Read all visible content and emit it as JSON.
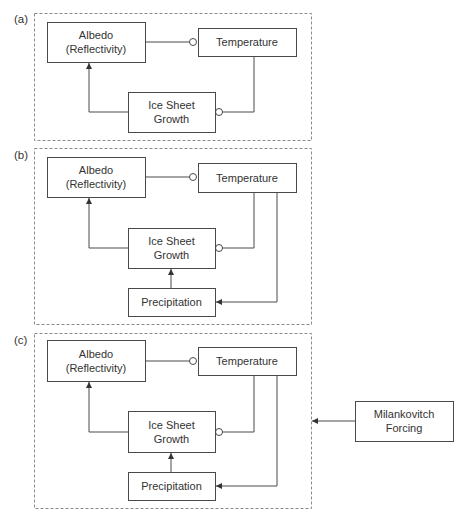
{
  "figure": {
    "width": 465,
    "height": 524,
    "colors": {
      "stroke": "#4a4a4a",
      "panel_border": "#8a8a8a",
      "text": "#333333",
      "background": "#ffffff"
    },
    "legend_semantics": {
      "arrow": "positive effect",
      "circle": "negative effect"
    }
  },
  "panels": [
    {
      "id": "a",
      "label": "(a)",
      "label_pos": [
        14,
        23
      ],
      "rect": [
        34,
        13,
        277,
        127
      ],
      "nodes": [
        {
          "id": "albedo",
          "lines": [
            "Albedo",
            "(Reflectivity)"
          ],
          "rect": [
            47,
            22,
            98,
            40
          ]
        },
        {
          "id": "temperature",
          "lines": [
            "Temperature"
          ],
          "rect": [
            198,
            28,
            98,
            28
          ]
        },
        {
          "id": "ice",
          "lines": [
            "Ice Sheet",
            "Growth"
          ],
          "rect": [
            128,
            92,
            87,
            40
          ]
        }
      ],
      "edges": [
        {
          "from": "albedo",
          "to": "temperature",
          "type": "negative",
          "points": [
            [
              145,
              42
            ],
            [
              193,
              42
            ]
          ],
          "marker_at": [
            193,
            42
          ]
        },
        {
          "from": "temperature",
          "to": "ice",
          "type": "negative",
          "points": [
            [
              254,
              56
            ],
            [
              254,
              112
            ],
            [
              219,
              112
            ]
          ],
          "marker_at": [
            219,
            112
          ]
        },
        {
          "from": "ice",
          "to": "albedo",
          "type": "positive",
          "points": [
            [
              128,
              112
            ],
            [
              89,
              112
            ],
            [
              89,
              63
            ]
          ],
          "arrow_at": [
            89,
            63
          ],
          "arrow_dir": "up"
        }
      ]
    },
    {
      "id": "b",
      "label": "(b)",
      "label_pos": [
        14,
        159
      ],
      "rect": [
        34,
        148,
        277,
        176
      ],
      "nodes": [
        {
          "id": "albedo",
          "lines": [
            "Albedo",
            "(Reflectivity)"
          ],
          "rect": [
            47,
            157,
            98,
            40
          ]
        },
        {
          "id": "temperature",
          "lines": [
            "Temperature"
          ],
          "rect": [
            198,
            163,
            98,
            29
          ]
        },
        {
          "id": "ice",
          "lines": [
            "Ice Sheet",
            "Growth"
          ],
          "rect": [
            128,
            228,
            87,
            40
          ]
        },
        {
          "id": "precipitation",
          "lines": [
            "Precipitation"
          ],
          "rect": [
            128,
            288,
            87,
            28
          ]
        }
      ],
      "edges": [
        {
          "from": "albedo",
          "to": "temperature",
          "type": "negative",
          "points": [
            [
              145,
              177
            ],
            [
              193,
              177
            ]
          ],
          "marker_at": [
            193,
            177
          ]
        },
        {
          "from": "temperature",
          "to": "ice",
          "type": "negative",
          "points": [
            [
              254,
              192
            ],
            [
              254,
              248
            ],
            [
              219,
              248
            ]
          ],
          "marker_at": [
            219,
            248
          ]
        },
        {
          "from": "temperature",
          "to": "precipitation",
          "type": "positive",
          "points": [
            [
              277,
              192
            ],
            [
              277,
              302
            ],
            [
              216,
              302
            ]
          ],
          "arrow_at": [
            216,
            302
          ],
          "arrow_dir": "left"
        },
        {
          "from": "precipitation",
          "to": "ice",
          "type": "positive",
          "points": [
            [
              171,
              288
            ],
            [
              171,
              269
            ]
          ],
          "arrow_at": [
            171,
            269
          ],
          "arrow_dir": "up"
        },
        {
          "from": "ice",
          "to": "albedo",
          "type": "positive",
          "points": [
            [
              128,
              248
            ],
            [
              89,
              248
            ],
            [
              89,
              198
            ]
          ],
          "arrow_at": [
            89,
            198
          ],
          "arrow_dir": "up"
        }
      ]
    },
    {
      "id": "c",
      "label": "(c)",
      "label_pos": [
        14,
        344
      ],
      "rect": [
        34,
        333,
        277,
        175
      ],
      "nodes": [
        {
          "id": "albedo",
          "lines": [
            "Albedo",
            "(Reflectivity)"
          ],
          "rect": [
            47,
            340,
            98,
            41
          ]
        },
        {
          "id": "temperature",
          "lines": [
            "Temperature"
          ],
          "rect": [
            198,
            347,
            98,
            28
          ]
        },
        {
          "id": "ice",
          "lines": [
            "Ice Sheet",
            "Growth"
          ],
          "rect": [
            128,
            411,
            87,
            41
          ]
        },
        {
          "id": "precipitation",
          "lines": [
            "Precipitation"
          ],
          "rect": [
            128,
            472,
            87,
            28
          ]
        }
      ],
      "edges": [
        {
          "from": "albedo",
          "to": "temperature",
          "type": "negative",
          "points": [
            [
              145,
              361
            ],
            [
              193,
              361
            ]
          ],
          "marker_at": [
            193,
            361
          ]
        },
        {
          "from": "temperature",
          "to": "ice",
          "type": "negative",
          "points": [
            [
              254,
              375
            ],
            [
              254,
              432
            ],
            [
              219,
              432
            ]
          ],
          "marker_at": [
            219,
            432
          ]
        },
        {
          "from": "temperature",
          "to": "precipitation",
          "type": "positive",
          "points": [
            [
              277,
              375
            ],
            [
              277,
              486
            ],
            [
              216,
              486
            ]
          ],
          "arrow_at": [
            216,
            486
          ],
          "arrow_dir": "left"
        },
        {
          "from": "precipitation",
          "to": "ice",
          "type": "positive",
          "points": [
            [
              171,
              472
            ],
            [
              171,
              453
            ]
          ],
          "arrow_at": [
            171,
            453
          ],
          "arrow_dir": "up"
        },
        {
          "from": "ice",
          "to": "albedo",
          "type": "positive",
          "points": [
            [
              128,
              432
            ],
            [
              89,
              432
            ],
            [
              89,
              382
            ]
          ],
          "arrow_at": [
            89,
            382
          ],
          "arrow_dir": "up"
        }
      ]
    }
  ],
  "external": {
    "node": {
      "id": "milankovitch",
      "lines": [
        "Milankovitch",
        "Forcing"
      ],
      "rect": [
        355,
        401,
        98,
        40
      ]
    },
    "edge": {
      "from": "milankovitch",
      "to": "panel-c",
      "type": "positive",
      "points": [
        [
          355,
          421
        ],
        [
          312,
          421
        ]
      ],
      "arrow_at": [
        312,
        421
      ],
      "arrow_dir": "left"
    }
  }
}
